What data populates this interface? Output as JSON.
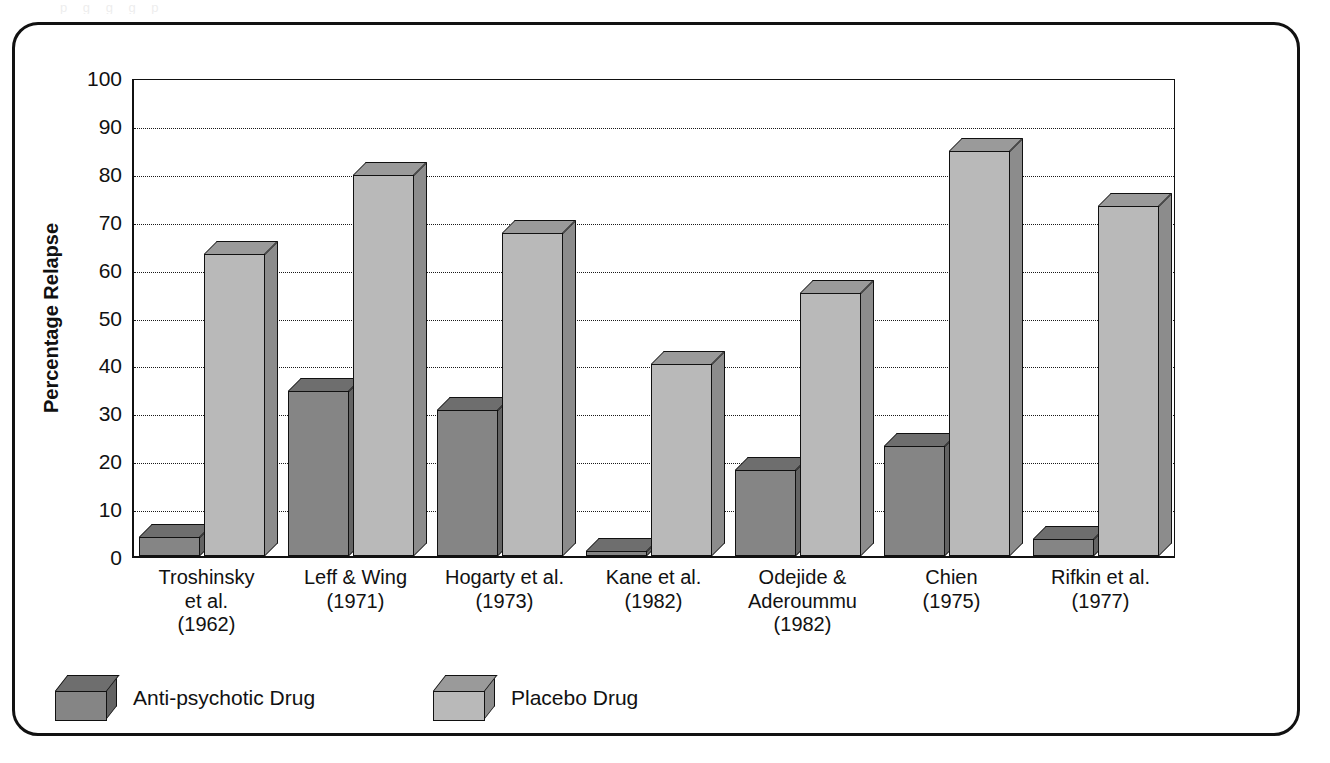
{
  "frame": {
    "bleed_text": "p       g      g        g              p"
  },
  "chart_data": {
    "type": "bar",
    "title": "",
    "xlabel": "",
    "ylabel": "Percentage Relapse",
    "ylim": [
      0,
      100
    ],
    "ytick_values": [
      100,
      90,
      80,
      70,
      60,
      50,
      40,
      30,
      20,
      10,
      0
    ],
    "ytick_labels": [
      "100",
      "90",
      "80",
      "70",
      "60",
      "50",
      "40",
      "30",
      "20",
      "10",
      "0"
    ],
    "grid": true,
    "grid_axis": "y",
    "legend_position": "bottom-left",
    "categories": [
      "Troshinsky et al. (1962)",
      "Leff & Wing (1971)",
      "Hogarty et al. (1973)",
      "Kane et al. (1982)",
      "Odejide & Aderoummu (1982)",
      "Chien (1975)",
      "Rifkin et al. (1977)"
    ],
    "category_lines": [
      [
        "Troshinsky",
        "et al.",
        "(1962)"
      ],
      [
        "Leff & Wing",
        "(1971)"
      ],
      [
        "Hogarty et al.",
        "(1973)"
      ],
      [
        "Kane et al.",
        "(1982)"
      ],
      [
        "Odejide &",
        "Aderoummu",
        "(1982)"
      ],
      [
        "Chien",
        "(1975)"
      ],
      [
        "Rifkin et al.",
        "(1977)"
      ]
    ],
    "series": [
      {
        "name": "Anti-psychotic Drug",
        "color": "#858585",
        "top_color": "#6e6e6e",
        "side_color": "#636363",
        "values": [
          4,
          34.5,
          30.5,
          1,
          18,
          23,
          3.5
        ]
      },
      {
        "name": "Placebo Drug",
        "color": "#b9b9b9",
        "top_color": "#9a9a9a",
        "side_color": "#8c8c8c",
        "values": [
          63,
          79.5,
          67.5,
          40,
          55,
          84.5,
          73
        ]
      }
    ]
  },
  "legend": {
    "items": [
      {
        "label": "Anti-psychotic Drug"
      },
      {
        "label": "Placebo Drug"
      }
    ]
  }
}
